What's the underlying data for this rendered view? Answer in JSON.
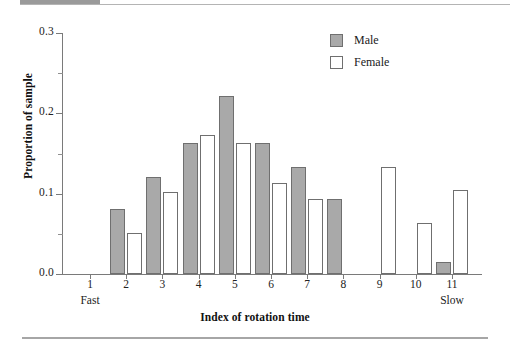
{
  "figure": {
    "decoration": {
      "top_block_label": "",
      "top_rule": "",
      "bottom_rule": ""
    }
  },
  "legend": {
    "position": "top-right",
    "entries": [
      {
        "label": "Male",
        "swatch": "filled-gray-square",
        "color": "#a9a9a9"
      },
      {
        "label": "Female",
        "swatch": "open-white-square",
        "color": "#ffffff"
      }
    ]
  },
  "axes": {
    "y_title": "Proportion of sample",
    "x_title": "Index of rotation time",
    "y_ticks": [
      "0.0",
      "0.1",
      "0.2",
      "0.3"
    ],
    "y_minor_ticks": [
      "0.05",
      "0.15",
      "0.25"
    ],
    "x_ticks": [
      "1",
      "2",
      "3",
      "4",
      "5",
      "6",
      "7",
      "8",
      "9",
      "10",
      "11"
    ],
    "x_end_labels": {
      "left": "Fast",
      "right": "Slow"
    }
  },
  "chart_data": {
    "type": "bar",
    "title": "",
    "subtitle": "",
    "xlabel": "Index of rotation time",
    "ylabel": "Proportion of sample",
    "categories": [
      "1",
      "2",
      "3",
      "4",
      "5",
      "6",
      "7",
      "8",
      "9",
      "10",
      "11"
    ],
    "series": [
      {
        "name": "Male",
        "color": "#a9a9a9",
        "values": [
          0,
          0.081,
          0.121,
          0.163,
          0.222,
          0.163,
          0.133,
          0.093,
          0,
          0,
          0.015
        ]
      },
      {
        "name": "Female",
        "color": "#ffffff",
        "values": [
          0,
          0.051,
          0.102,
          0.173,
          0.163,
          0.113,
          0.093,
          0,
          0.133,
          0.063,
          0.105
        ]
      }
    ],
    "ylim": [
      0.0,
      0.3
    ],
    "ytick_values": [
      0.0,
      0.1,
      0.2,
      0.3
    ],
    "yminor_tick_values": [
      0.05,
      0.15,
      0.25
    ],
    "grid": false,
    "legend_position": "top-right",
    "annotations": [
      {
        "text": "Fast",
        "at_category": "1",
        "placement": "below-axis"
      },
      {
        "text": "Slow",
        "at_category": "11",
        "placement": "below-axis"
      }
    ]
  }
}
